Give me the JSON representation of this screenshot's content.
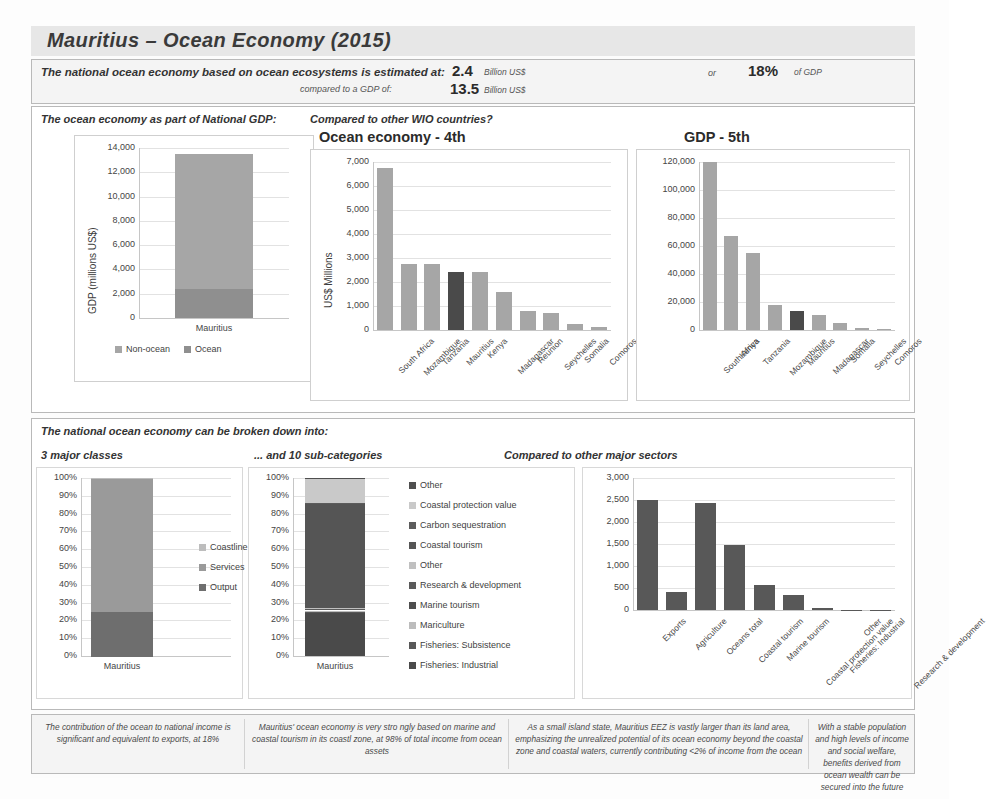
{
  "title": "Mauritius – Ocean Economy (2015)",
  "summary": {
    "line1": "The national ocean economy based on ocean ecosystems is estimated at:",
    "line2": "compared to a GDP of:",
    "value1": "2.4",
    "unit1": "Billion US$",
    "value2": "13.5",
    "unit2": "Billion US$",
    "or": "or",
    "percent": "18%",
    "percent_unit": "of GDP"
  },
  "upper": {
    "label_left": "The ocean economy as part of National GDP:",
    "label_right": "Compared to other WIO countries?"
  },
  "lower": {
    "intro": "The national ocean economy can be broken down into:",
    "label_classes": "3 major classes",
    "label_subcats": "... and 10 sub-categories",
    "label_sectors": "Compared to other major sectors"
  },
  "footnotes": [
    "The contribution of the ocean to national income is significant and equivalent to exports, at 18%",
    "Mauritius' ocean economy is very stro ngly based on marine and coastal tourism in its coastl zone, at 98% of total income from ocean assets",
    "As a small island state, Mauritius EEZ is vastly larger than its land area, emphasizing the unrealized potential of its ocean economy beyond the coastal zone and coastal waters, currently contributing <2% of income from the ocean",
    "With a stable population and high levels of income and social welfare, benefits derived from ocean wealth can be secured into the future"
  ],
  "colors": {
    "bar_light": "#a6a6a6",
    "bar_mid": "#8f8f8f",
    "bar_dark": "#585858",
    "bar_highlight": "#4a4a4a",
    "legend_light": "#c9c9c9",
    "panel_border": "#b9b9b9"
  },
  "chart_data": [
    {
      "id": "gdp-stacked",
      "type": "bar",
      "title": "",
      "ylabel": "GDP (millions US$)",
      "xlabel": "",
      "categories": [
        "Mauritius"
      ],
      "yticks": [
        "0",
        "2,000",
        "4,000",
        "6,000",
        "8,000",
        "10,000",
        "12,000",
        "14,000"
      ],
      "ylim": [
        0,
        14000
      ],
      "grid": true,
      "legend_position": "bottom",
      "series": [
        {
          "name": "Non-ocean",
          "values": [
            11100
          ],
          "color": "#a6a6a6"
        },
        {
          "name": "Ocean",
          "values": [
            2400
          ],
          "color": "#8f8f8f"
        }
      ]
    },
    {
      "id": "ocean-economy-wio",
      "type": "bar",
      "title": "Ocean economy - 4th",
      "ylabel": "US$ Millions",
      "xlabel": "",
      "categories": [
        "South Africa",
        "Mozambique",
        "Tanzania",
        "Mauritius",
        "Kenya",
        "Madagascar",
        "Reunion",
        "Seychelles",
        "Somalia",
        "Comoros"
      ],
      "values": [
        6750,
        2750,
        2740,
        2430,
        2400,
        1600,
        780,
        700,
        270,
        120
      ],
      "highlight_index": 3,
      "yticks": [
        "0",
        "1,000",
        "2,000",
        "3,000",
        "4,000",
        "5,000",
        "6,000",
        "7,000"
      ],
      "ylim": [
        0,
        7000
      ],
      "grid": true
    },
    {
      "id": "gdp-wio",
      "type": "bar",
      "title": "GDP - 5th",
      "ylabel": "",
      "xlabel": "",
      "categories": [
        "South Africa",
        "Kenya",
        "Tanzania",
        "Mozambique",
        "Mauritius",
        "Madagascar",
        "Somalia",
        "Seychelles",
        "Comoros"
      ],
      "values": [
        120000,
        67000,
        55000,
        18000,
        13500,
        11000,
        5000,
        1500,
        700
      ],
      "highlight_index": 4,
      "yticks": [
        "0",
        "20,000",
        "40,000",
        "60,000",
        "80,000",
        "100,000",
        "120,000"
      ],
      "ylim": [
        0,
        120000
      ],
      "grid": true
    },
    {
      "id": "three-classes",
      "type": "bar",
      "title": "",
      "ylabel": "",
      "categories": [
        "Mauritius"
      ],
      "yticks": [
        "0%",
        "10%",
        "20%",
        "30%",
        "40%",
        "50%",
        "60%",
        "70%",
        "80%",
        "90%",
        "100%"
      ],
      "ylim": [
        0,
        100
      ],
      "grid": true,
      "legend_position": "right",
      "series": [
        {
          "name": "Coastline",
          "values": [
            0.5
          ],
          "color": "#bdbdbd"
        },
        {
          "name": "Services",
          "values": [
            74.5
          ],
          "color": "#9a9a9a"
        },
        {
          "name": "Output",
          "values": [
            25
          ],
          "color": "#6e6e6e"
        }
      ]
    },
    {
      "id": "ten-subcategories",
      "type": "bar",
      "title": "",
      "ylabel": "",
      "categories": [
        "Mauritius"
      ],
      "yticks": [
        "0%",
        "10%",
        "20%",
        "30%",
        "40%",
        "50%",
        "60%",
        "70%",
        "80%",
        "90%",
        "100%"
      ],
      "ylim": [
        0,
        100
      ],
      "grid": true,
      "legend_position": "right",
      "series": [
        {
          "name": "Other",
          "values": [
            0.4
          ],
          "color": "#4f4f4f"
        },
        {
          "name": "Coastal protection value",
          "values": [
            13.6
          ],
          "color": "#c9c9c9"
        },
        {
          "name": "Carbon sequestration",
          "values": [
            0.3
          ],
          "color": "#5c5c5c"
        },
        {
          "name": "Coastal tourism",
          "values": [
            59
          ],
          "color": "#555555"
        },
        {
          "name": "Other",
          "values": [
            0.3
          ],
          "color": "#c0c0c0"
        },
        {
          "name": "Research & development",
          "values": [
            0.2
          ],
          "color": "#5a5a5a"
        },
        {
          "name": "Marine tourism",
          "values": [
            0.8
          ],
          "color": "#4e4e4e"
        },
        {
          "name": "Mariculture",
          "values": [
            0.4
          ],
          "color": "#bcbcbc"
        },
        {
          "name": "Fisheries: Subsistence",
          "values": [
            0.5
          ],
          "color": "#585858"
        },
        {
          "name": "Fisheries: Industrial",
          "values": [
            24.5
          ],
          "color": "#4a4a4a"
        }
      ]
    },
    {
      "id": "major-sectors",
      "type": "bar",
      "title": "",
      "ylabel": "",
      "categories": [
        "Exports",
        "Agriculture",
        "Oceans total",
        "Coastal tourism",
        "Marine tourism",
        "Coastal protection value",
        "Fisheries: Industrial",
        "Other",
        "Research & development"
      ],
      "values": [
        2500,
        420,
        2430,
        1480,
        570,
        340,
        50,
        10,
        5
      ],
      "yticks": [
        "0",
        "500",
        "1,000",
        "1,500",
        "2,000",
        "2,500",
        "3,000"
      ],
      "ylim": [
        0,
        3000
      ],
      "grid": true
    }
  ]
}
